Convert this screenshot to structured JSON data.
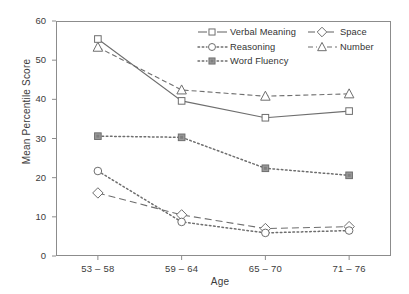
{
  "chart_data": {
    "type": "line",
    "title": "",
    "xlabel": "Age",
    "ylabel": "Mean Percentile Score",
    "categories": [
      "53 – 58",
      "59 – 64",
      "65 – 70",
      "71 – 76"
    ],
    "ylim": [
      0,
      60
    ],
    "yticks": [
      "0",
      "10",
      "20",
      "30",
      "40",
      "50",
      "60"
    ],
    "grid": false,
    "legend_position": "top-right-inside",
    "series": [
      {
        "name": "Verbal Meaning",
        "marker": "open-square",
        "line": "solid",
        "values": [
          55.4,
          39.6,
          35.3,
          37.0
        ]
      },
      {
        "name": "Space",
        "marker": "open-diamond",
        "line": "dashed",
        "values": [
          16.1,
          10.5,
          7.0,
          7.5
        ]
      },
      {
        "name": "Reasoning",
        "marker": "open-circle",
        "line": "dotted",
        "values": [
          21.7,
          8.7,
          5.9,
          6.5
        ]
      },
      {
        "name": "Number",
        "marker": "open-triangle",
        "line": "dash-dot",
        "values": [
          53.3,
          42.4,
          40.8,
          41.4
        ]
      },
      {
        "name": "Word Fluency",
        "marker": "filled-square",
        "line": "dotted",
        "values": [
          30.6,
          30.3,
          22.4,
          20.6
        ]
      }
    ],
    "colors": {
      "ink": "#6e6e6e",
      "text": "#3c3c3c",
      "fill": "#9a9a9a"
    }
  }
}
